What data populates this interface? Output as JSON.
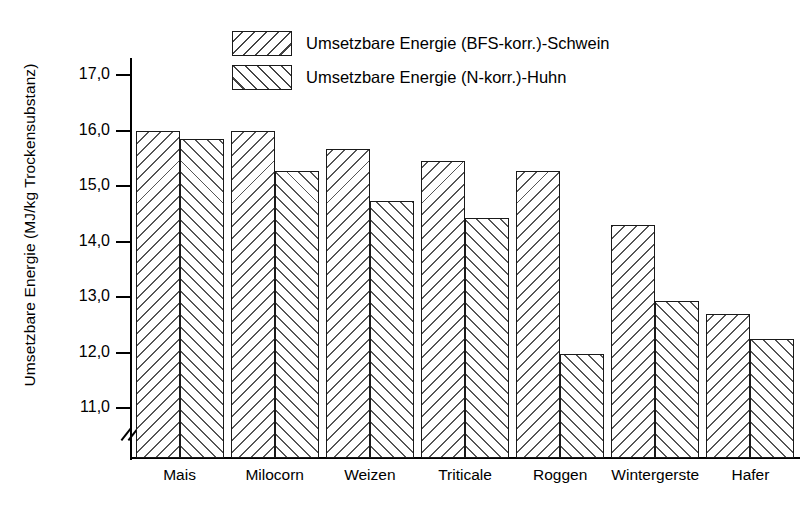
{
  "chart_data": {
    "type": "bar",
    "title": "",
    "xlabel": "",
    "ylabel": "Umsetzbare Energie (MJ/kg Trockensubstanz)",
    "categories": [
      "Mais",
      "Milocorn",
      "Weizen",
      "Triticale",
      "Roggen",
      "Wintergerste",
      "Hafer"
    ],
    "series": [
      {
        "name": "Umsetzbare Energie (BFS-korr.)-Schwein",
        "hatch": "backslash",
        "values": [
          16.0,
          16.0,
          15.67,
          15.45,
          15.27,
          14.29,
          12.7
        ]
      },
      {
        "name": "Umsetzbare Energie (N-korr.)-Huhn",
        "hatch": "forwardslash",
        "values": [
          15.85,
          15.27,
          14.73,
          14.42,
          11.97,
          12.92,
          12.25
        ]
      }
    ],
    "ylim": [
      10.1,
      17.4
    ],
    "yticks": [
      11.0,
      12.0,
      13.0,
      14.0,
      15.0,
      16.0,
      17.0
    ],
    "ytick_labels": [
      "11,0",
      "12,0",
      "13,0",
      "14,0",
      "15,0",
      "16,0",
      "17,0"
    ],
    "axis_break": true,
    "axis_break_symbol": "//",
    "grid": false,
    "legend_position": "top-center",
    "decimal_separator": ","
  }
}
